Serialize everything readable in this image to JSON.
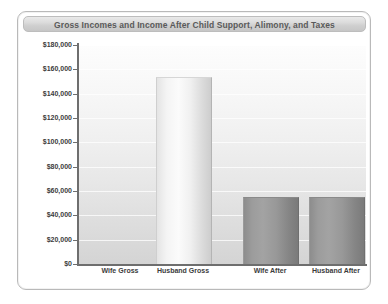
{
  "chart_data": {
    "type": "bar",
    "title": "Gross Incomes and Income After Child Support, Alimony, and Taxes",
    "xlabel": "",
    "ylabel": "",
    "categories": [
      "Wife Gross",
      "Husband Gross",
      "Wife After",
      "Husband After"
    ],
    "values": [
      0,
      153000,
      54000,
      54500
    ],
    "ylim": [
      0,
      180000
    ],
    "yticks": [
      0,
      20000,
      40000,
      60000,
      80000,
      100000,
      120000,
      140000,
      160000,
      180000
    ],
    "ytick_labels": [
      "$0",
      "$20,000",
      "$40,000",
      "$60,000",
      "$80,000",
      "$100,000",
      "$120,000",
      "$140,000",
      "$160,000",
      "$180,000"
    ],
    "grid": true,
    "legend": false,
    "bar_styles": [
      "none",
      "light",
      "dark",
      "dark"
    ],
    "colors": {
      "bar_light": "#f4f4f4",
      "bar_dark": "#979797",
      "axis": "#6e6e6e",
      "title_text": "#5a5a5a",
      "tick_text": "#3c3c3c",
      "plot_background_top": "#fdfdfd",
      "plot_background_bottom": "#d4d4d4",
      "frame_border": "#b9b9b9",
      "title_band": "#d6d6d6"
    }
  }
}
